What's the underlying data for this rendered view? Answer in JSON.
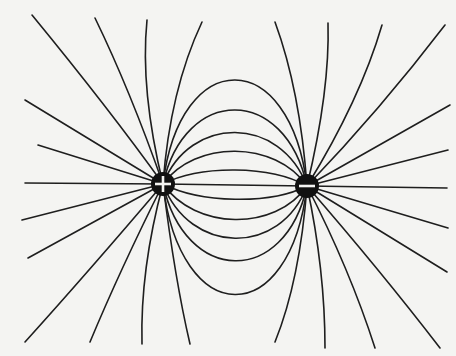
{
  "diagram": {
    "title": "",
    "type": "electric-dipole-field-lines",
    "charges": [
      {
        "name": "positive-charge",
        "sign": "+",
        "x": 163,
        "y": 184,
        "r": 12
      },
      {
        "name": "negative-charge",
        "sign": "−",
        "x": 307,
        "y": 186,
        "r": 12
      }
    ],
    "colors": {
      "background": "#f4f4f2",
      "line": "#1e1e1e",
      "charge": "#111111"
    }
  }
}
